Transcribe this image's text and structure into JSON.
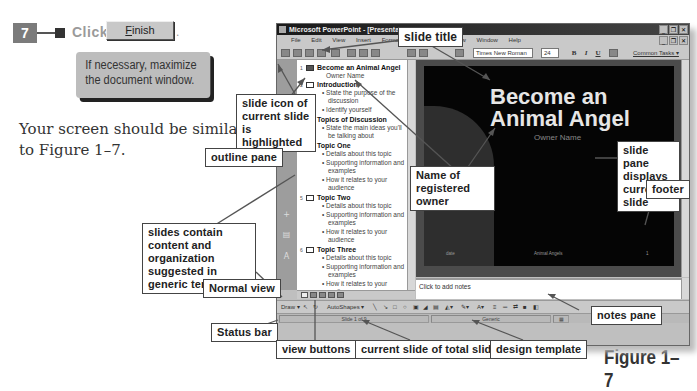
{
  "instruction": {
    "step_number": "7",
    "click_label": "Click",
    "button_label": "Finish",
    "button_mnemonic": "F",
    "button_rest": "inish",
    "period": ".",
    "tip": "If necessary, maximize the document window."
  },
  "body_text": "Your screen should be similar to Figure 1–7.",
  "figure_label": "Figure 1–7",
  "window": {
    "title": "Microsoft PowerPoint - [Presentation1]",
    "controls": [
      "_",
      "❐",
      "✕"
    ],
    "doc_controls": [
      "_",
      "❐",
      "✕"
    ],
    "menu": [
      "File",
      "Edit",
      "View",
      "Insert",
      "Format",
      "Tools",
      "Slide Show",
      "Window",
      "Help"
    ],
    "toolbar": {
      "font_name": "Times New Roman",
      "font_size": "24",
      "bold": "B",
      "italic": "I",
      "underline": "U",
      "common_tasks": "Common Tasks ▾"
    },
    "outline": [
      {
        "num": "1",
        "title": "Become an Animal Angel",
        "highlighted": true,
        "sub": [
          "Owner Name"
        ],
        "bullets": []
      },
      {
        "num": "2",
        "title": "Introduction",
        "highlighted": false,
        "sub": [],
        "bullets": [
          "State the purpose of the discussion",
          "Identify yourself"
        ]
      },
      {
        "num": "3",
        "title": "Topics of Discussion",
        "highlighted": false,
        "sub": [],
        "bullets": [
          "State the main ideas you'll be talking about"
        ]
      },
      {
        "num": "4",
        "title": "Topic One",
        "highlighted": false,
        "sub": [],
        "bullets": [
          "Details about this topic",
          "Supporting information and examples",
          "How it relates to your audience"
        ]
      },
      {
        "num": "5",
        "title": "Topic Two",
        "highlighted": false,
        "sub": [],
        "bullets": [
          "Details about this topic",
          "Supporting information and examples",
          "How it relates to your audience"
        ]
      },
      {
        "num": "6",
        "title": "Topic Three",
        "highlighted": false,
        "sub": [],
        "bullets": [
          "Details about this topic",
          "Supporting information and examples",
          "How it relates to your audience"
        ]
      }
    ],
    "slide": {
      "title": "Become an Animal Angel",
      "owner": "Owner Name",
      "footer_left": "date",
      "footer_center": "Animal Angels",
      "footer_right": "1"
    },
    "notes_placeholder": "Click to add notes",
    "draw_bar": {
      "draw": "Draw ▾",
      "autoshapes": "AutoShapes ▾"
    },
    "status": {
      "slide_position": "Slide 1 of 9",
      "design_template": "Generic"
    }
  },
  "callouts": {
    "slide_title": "slide title",
    "slide_icon": "slide icon of current slide is highlighted",
    "outline_pane": "outline pane",
    "registered_owner": "Name of registered owner",
    "slide_pane": "slide pane displays current slide",
    "footer": "footer",
    "slides_contain": "slides contain content and organization suggested in generic template",
    "normal_view": "Normal view",
    "status_bar": "Status bar",
    "notes_pane": "notes pane",
    "view_buttons": "view buttons",
    "current_slide": "current slide of total slides",
    "design_template": "design template"
  }
}
